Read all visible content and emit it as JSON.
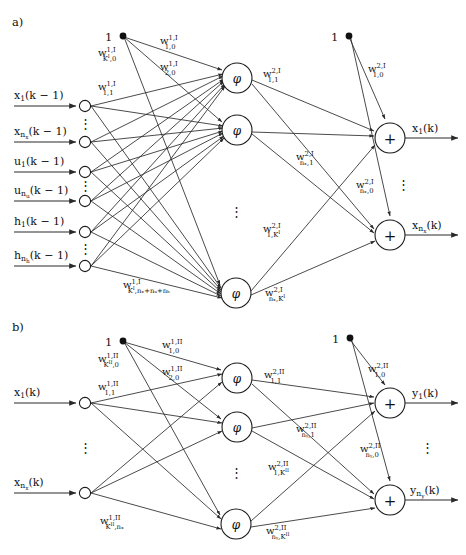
{
  "figure": {
    "type": "neural-network-diagram",
    "width": 466,
    "height": 555,
    "panels": [
      {
        "tag": "a)",
        "description": "State-transition network: inputs x, u, h delayed by one step map through hidden layer I to next state x(k)",
        "bias_label": "1",
        "activation_symbol": "φ",
        "sum_symbol": "+",
        "inputs": [
          "x₁(k − 1)",
          "xₙₓ(k − 1)",
          "u₁(k − 1)",
          "uₙᵤ(k − 1)",
          "h₁(k − 1)",
          "hₙₕ(k − 1)"
        ],
        "outputs": [
          "x₁(k)",
          "xₙₓ(k)"
        ],
        "weights_layer1": [
          "w^{1,I}_{1,0}",
          "w^{1,I}_{2,0}",
          "w^{1,I}_{K^I,0}",
          "w^{1,I}_{1,1}",
          "w^{1,I}_{K^I,n_x+n_u+n_h}"
        ],
        "weights_layer2": [
          "w^{2,I}_{1,0}",
          "w^{2,I}_{1,1}",
          "w^{2,I}_{n_x,0}",
          "w^{2,I}_{n_x,1}",
          "w^{2,I}_{1,K^I}",
          "w^{2,I}_{n_x,K^I}"
        ]
      },
      {
        "tag": "b)",
        "description": "Output network: current state x(k) maps through hidden layer II to outputs y(k)",
        "bias_label": "1",
        "activation_symbol": "φ",
        "sum_symbol": "+",
        "inputs": [
          "x₁(k)",
          "xₙₓ(k)"
        ],
        "outputs": [
          "y₁(k)",
          "yₙᵧ(k)"
        ],
        "weights_layer1": [
          "w^{1,II}_{1,0}",
          "w^{1,II}_{2,0}",
          "w^{1,II}_{K^{II},0}",
          "w^{1,II}_{1,1}",
          "w^{1,II}_{K^{II},n_x}"
        ],
        "weights_layer2": [
          "w^{2,II}_{1,0}",
          "w^{2,II}_{1,1}",
          "w^{2,II}_{n_y,0}",
          "w^{2,II}_{n_y,1}",
          "w^{2,II}_{1,K^{II}}",
          "w^{2,II}_{n_y,K^{II}}"
        ]
      }
    ]
  },
  "panel_a": {
    "tag": "a)",
    "bias1": "1",
    "bias2": "1",
    "neuron": "φ",
    "sum": "+",
    "ellipsis": "⋮",
    "inputs": {
      "i1": {
        "base": "x",
        "sub": "1",
        "arg": "(k − 1)"
      },
      "i2": {
        "base": "x",
        "sub": "n",
        "subsub": "x",
        "arg": "(k − 1)"
      },
      "i3": {
        "base": "u",
        "sub": "1",
        "arg": "(k − 1)"
      },
      "i4": {
        "base": "u",
        "sub": "n",
        "subsub": "u",
        "arg": "(k − 1)"
      },
      "i5": {
        "base": "h",
        "sub": "1",
        "arg": "(k − 1)"
      },
      "i6": {
        "base": "h",
        "sub": "n",
        "subsub": "h",
        "arg": "(k − 1)"
      }
    },
    "outputs": {
      "o1": {
        "base": "x",
        "sub": "1",
        "arg": "(k)"
      },
      "o2": {
        "base": "x",
        "sub": "n",
        "subsub": "x",
        "arg": "(k)"
      }
    },
    "w": {
      "w1_1_0": {
        "base": "w",
        "sup": "1,I",
        "sub": "1,0"
      },
      "w1_2_0": {
        "base": "w",
        "sup": "1,I",
        "sub": "2,0"
      },
      "w1_K_0": {
        "base": "w",
        "sup": "1,I",
        "sub": "K",
        "subsup": "I",
        "subtail": ",0"
      },
      "w1_1_1": {
        "base": "w",
        "sup": "1,I",
        "sub": "1,1"
      },
      "w1_K_n": {
        "base": "w",
        "sup": "1,I",
        "sub": "K",
        "subsup": "I",
        "subtail": ",nₓ+nᵤ+nₕ"
      },
      "w2_1_0": {
        "base": "w",
        "sup": "2,I",
        "sub": "1,0"
      },
      "w2_1_1": {
        "base": "w",
        "sup": "2,I",
        "sub": "1,1"
      },
      "w2_nx_1": {
        "base": "w",
        "sup": "2,I",
        "sub": "nₓ,1"
      },
      "w2_nx_0": {
        "base": "w",
        "sup": "2,I",
        "sub": "nₓ,0"
      },
      "w2_1_K": {
        "base": "w",
        "sup": "2,I",
        "sub": "1,K",
        "subsup": "I"
      },
      "w2_nx_K": {
        "base": "w",
        "sup": "2,I",
        "sub": "nₓ,K",
        "subsup": "I"
      }
    }
  },
  "panel_b": {
    "tag": "b)",
    "bias1": "1",
    "bias2": "1",
    "neuron": "φ",
    "sum": "+",
    "ellipsis": "⋮",
    "inputs": {
      "i1": {
        "base": "x",
        "sub": "1",
        "arg": "(k)"
      },
      "i2": {
        "base": "x",
        "sub": "n",
        "subsub": "x",
        "arg": "(k)"
      }
    },
    "outputs": {
      "o1": {
        "base": "y",
        "sub": "1",
        "arg": "(k)"
      },
      "o2": {
        "base": "y",
        "sub": "n",
        "subsub": "y",
        "arg": "(k)"
      }
    },
    "w": {
      "w1_1_0": {
        "base": "w",
        "sup": "1,II",
        "sub": "1,0"
      },
      "w1_2_0": {
        "base": "w",
        "sup": "1,II",
        "sub": "2,0"
      },
      "w1_K_0": {
        "base": "w",
        "sup": "1,II",
        "sub": "K",
        "subsup": "II",
        "subtail": ",0"
      },
      "w1_1_1": {
        "base": "w",
        "sup": "1,II",
        "sub": "1,1"
      },
      "w1_K_n": {
        "base": "w",
        "sup": "1,II",
        "sub": "K",
        "subsup": "II",
        "subtail": ",nₓ"
      },
      "w2_1_0": {
        "base": "w",
        "sup": "2,II",
        "sub": "1,0"
      },
      "w2_1_1": {
        "base": "w",
        "sup": "2,II",
        "sub": "1,1"
      },
      "w2_ny_1": {
        "base": "w",
        "sup": "2,II",
        "sub": "nᵧ,1"
      },
      "w2_ny_0": {
        "base": "w",
        "sup": "2,II",
        "sub": "nᵧ,0"
      },
      "w2_1_K": {
        "base": "w",
        "sup": "2,II",
        "sub": "1,K",
        "subsup": "II"
      },
      "w2_ny_K": {
        "base": "w",
        "sup": "2,II",
        "sub": "nᵧ,K",
        "subsup": "II"
      }
    }
  }
}
